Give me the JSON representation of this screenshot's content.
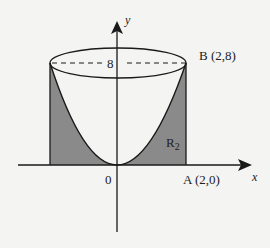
{
  "diagram": {
    "axes": {
      "x_label": "x",
      "y_label": "y",
      "origin_label": "0"
    },
    "y_tick_label": "8",
    "points": {
      "A": {
        "label": "A (2,0)",
        "x": 2,
        "y": 0
      },
      "B": {
        "label": "B (2,8)",
        "x": 2,
        "y": 8
      }
    },
    "region_label": "R",
    "region_subscript": "2",
    "curve": "y = 2x^2",
    "colors": {
      "shade": "#8a8a8a",
      "line": "#1a1a1a",
      "background": "#f4f4f2"
    }
  }
}
